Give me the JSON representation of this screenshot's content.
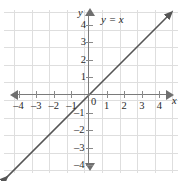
{
  "chart_data": {
    "type": "line",
    "title": "",
    "equation_label": "y = x",
    "xlabel": "x",
    "ylabel": "y",
    "origin_label": "0",
    "xlim": [
      -4.6,
      4.6
    ],
    "ylim": [
      -4.6,
      4.6
    ],
    "grid": true,
    "legend": "none",
    "x_tick_labels": [
      "–4",
      "–3",
      "–2",
      "–1",
      "1",
      "2",
      "3",
      "4"
    ],
    "x_tick_values": [
      -4,
      -3,
      -2,
      -1,
      1,
      2,
      3,
      4
    ],
    "y_tick_labels": [
      "4",
      "3",
      "2",
      "1",
      "–1",
      "–2",
      "–3",
      "–4"
    ],
    "y_tick_values": [
      4,
      3,
      2,
      1,
      -1,
      -2,
      -3,
      -4
    ],
    "series": [
      {
        "name": "y = x",
        "slope": 1,
        "intercept": 0,
        "x": [
          -4.6,
          -3,
          -2,
          -1,
          0,
          1,
          2,
          3,
          4.6
        ],
        "values": [
          -4.6,
          -3,
          -2,
          -1,
          0,
          1,
          2,
          3,
          4.6
        ],
        "arrows_both_ends": true,
        "color": "#555555"
      }
    ],
    "annotations": [
      {
        "text": "y = x",
        "x": 1.1,
        "y": 4.35
      }
    ],
    "colors": {
      "grid": "#dedede",
      "axis": "#7a7a7a",
      "line": "#555555",
      "text": "#2b2b2b"
    }
  }
}
